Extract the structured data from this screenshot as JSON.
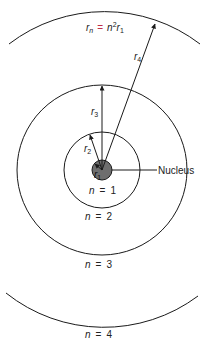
{
  "diagram": {
    "type": "bohr-model-orbits",
    "formula": {
      "lhs": "r",
      "lhs_sub": "n",
      "equals": "=",
      "rhs_n": "n",
      "rhs_exp": "2",
      "rhs_r": "r",
      "rhs_sub": "1",
      "equals_color": "#c0304a"
    },
    "nucleus": {
      "label": "Nucleus",
      "fill": "#6e6e6e"
    },
    "orbits": [
      {
        "n_label": "n",
        "eq": "=",
        "value": "1"
      },
      {
        "n_label": "n",
        "eq": "=",
        "value": "2"
      },
      {
        "n_label": "n",
        "eq": "=",
        "value": "3"
      },
      {
        "n_label": "n",
        "eq": "=",
        "value": "4"
      }
    ],
    "radii_labels": [
      {
        "r": "r",
        "sub": "1"
      },
      {
        "r": "r",
        "sub": "2"
      },
      {
        "r": "r",
        "sub": "3"
      },
      {
        "r": "r",
        "sub": "4"
      }
    ],
    "line_color": "#1a1a1a"
  }
}
